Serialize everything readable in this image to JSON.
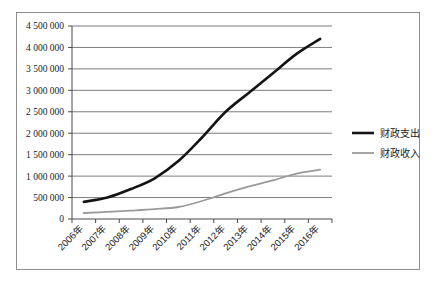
{
  "chart_data": {
    "type": "line",
    "title": "",
    "subtitle": "",
    "xlabel": "",
    "ylabel": "",
    "categories": [
      "2006年",
      "2007年",
      "2008年",
      "2009年",
      "2010年",
      "2011年",
      "2012年",
      "2013年",
      "2014年",
      "2015年",
      "2016年"
    ],
    "series": [
      {
        "name": "财政支出",
        "color": "#141414",
        "width": 2.6,
        "values": [
          400000,
          500000,
          700000,
          950000,
          1350000,
          1900000,
          2500000,
          2950000,
          3400000,
          3850000,
          4200000
        ]
      },
      {
        "name": "财政收入",
        "color": "#9a9a9a",
        "width": 1.8,
        "values": [
          140000,
          165000,
          195000,
          230000,
          280000,
          420000,
          600000,
          760000,
          900000,
          1060000,
          1150000
        ]
      }
    ],
    "ylim": [
      0,
      4500000
    ],
    "ytick_step": 500000,
    "ytick_labels": [
      "0",
      "500 000",
      "1 000 000",
      "1 500 000",
      "2 000 000",
      "2 500 000",
      "3 000 000",
      "3 500 000",
      "4 000 000",
      "4 500 000"
    ],
    "grid": true,
    "grid_axis": "y",
    "legend_position": "right",
    "xtick_rotation": -45
  },
  "legend": {
    "items": [
      {
        "label": "财政支出",
        "swatch": "expenditure-line-swatch"
      },
      {
        "label": "财政收入",
        "swatch": "revenue-line-swatch"
      }
    ]
  },
  "colors": {
    "expenditure": "#141414",
    "revenue": "#9a9a9a",
    "gridline": "#6e6e6e",
    "axis": "#4a4a4a",
    "frame": "#8d8d8d",
    "text": "#1a1a1a",
    "background": "#ffffff"
  }
}
